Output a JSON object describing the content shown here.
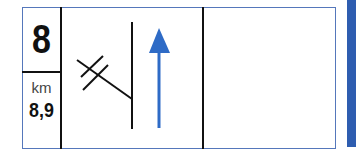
{
  "sign": {
    "exit_number": "8",
    "distance_unit": "km",
    "distance_value": "8,9",
    "colors": {
      "border": "#5577bb",
      "arrow": "#2e6bc6",
      "bar": "#2e5db0",
      "lines": "#111111"
    },
    "symbols": [
      "exit-ramp-icon",
      "straight-arrow-icon"
    ]
  }
}
